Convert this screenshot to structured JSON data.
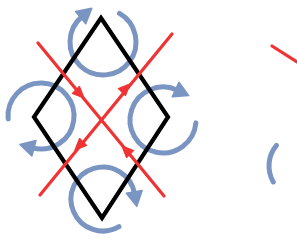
{
  "figure": {
    "title": "Rhombus with crossing red diagonals and four blue rotation arrows",
    "canvas": {
      "width": 297,
      "height": 248,
      "background": "#ffffff"
    },
    "colors": {
      "outline": "#000000",
      "diagonal": "#f03232",
      "rotation_arrow": "#7a95c2",
      "background": "#ffffff"
    },
    "stroke_widths": {
      "outline": 4.2,
      "diagonal": 3.2,
      "rotation_arrow": 5.0
    },
    "shapes": {
      "rhombus": {
        "label": "black-rhombus",
        "vertices": [
          {
            "name": "top",
            "x": 101,
            "y": 18
          },
          {
            "name": "right",
            "x": 168,
            "y": 117
          },
          {
            "name": "bottom",
            "x": 102,
            "y": 218
          },
          {
            "name": "left",
            "x": 34,
            "y": 117
          }
        ]
      },
      "diagonals": [
        {
          "label": "diagonal-nw-se",
          "from": {
            "x": 38,
            "y": 43
          },
          "to": {
            "x": 164,
            "y": 196
          },
          "arrowheads": [
            {
              "at": {
                "x": 80,
                "y": 94
              },
              "direction": "south-east"
            },
            {
              "at": {
                "x": 126,
                "y": 150
              },
              "direction": "north-west"
            }
          ]
        },
        {
          "label": "diagonal-sw-ne",
          "from": {
            "x": 40,
            "y": 195
          },
          "to": {
            "x": 172,
            "y": 34
          },
          "arrowheads": [
            {
              "at": {
                "x": 126,
                "y": 88
              },
              "direction": "north-east"
            },
            {
              "at": {
                "x": 79,
                "y": 146
              },
              "direction": "south-west"
            }
          ]
        }
      ],
      "rotation_arrows": [
        {
          "label": "rotation-arrow-top",
          "vertex": "top",
          "center": {
            "x": 103,
            "y": 42
          },
          "radius": 33,
          "start_angle_deg": 300,
          "sweep_deg": 290,
          "sense": "clockwise",
          "arrowhead_direction": "north-east"
        },
        {
          "label": "rotation-arrow-left",
          "vertex": "left",
          "center": {
            "x": 41,
            "y": 116
          },
          "radius": 33,
          "start_angle_deg": 175,
          "sweep_deg": 290,
          "sense": "clockwise",
          "arrowhead_direction": "south-west"
        },
        {
          "label": "rotation-arrow-right",
          "vertex": "right",
          "center": {
            "x": 163,
            "y": 120
          },
          "radius": 33,
          "start_angle_deg": 5,
          "sweep_deg": 290,
          "sense": "clockwise",
          "arrowhead_direction": "north-east"
        },
        {
          "label": "rotation-arrow-bottom",
          "vertex": "bottom",
          "center": {
            "x": 103,
            "y": 199
          },
          "radius": 32,
          "start_angle_deg": 60,
          "sweep_deg": 290,
          "sense": "clockwise",
          "arrowhead_direction": "south-west"
        }
      ],
      "neighbor_fragments": [
        {
          "label": "neighbor-diagonal-fragment",
          "type": "red-line",
          "from": {
            "x": 272,
            "y": 46
          },
          "to": {
            "x": 297,
            "y": 62
          }
        },
        {
          "label": "neighbor-rotation-arc-fragment",
          "type": "blue-arc",
          "center": {
            "x": 301,
            "y": 166
          },
          "radius": 32,
          "start_angle_deg": 150,
          "sweep_deg": 70
        }
      ]
    }
  }
}
